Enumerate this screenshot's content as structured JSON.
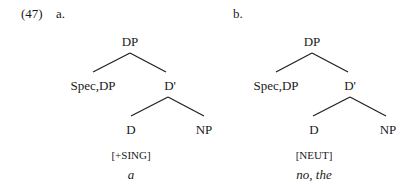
{
  "example": {
    "number": "(47)",
    "trees": [
      {
        "label": "a.",
        "root": "DP",
        "spec": "Spec,DP",
        "dbar": "D'",
        "head": "D",
        "complement": "NP",
        "feature": "[+SING]",
        "gloss": "a"
      },
      {
        "label": "b.",
        "root": "DP",
        "spec": "Spec,DP",
        "dbar": "D'",
        "head": "D",
        "complement": "NP",
        "feature": "[NEUT]",
        "gloss": "no, the"
      }
    ]
  }
}
